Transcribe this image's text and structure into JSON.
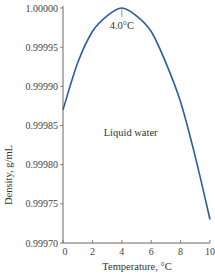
{
  "chart_data": {
    "type": "line",
    "title": "",
    "xlabel": "Temperature, °C",
    "ylabel": "Density, g/mL",
    "xlim": [
      0,
      10
    ],
    "ylim": [
      0.9997,
      1.0
    ],
    "x_ticks": [
      "0",
      "2",
      "4",
      "6",
      "8",
      "10"
    ],
    "y_ticks": [
      "0.99970",
      "0.99975",
      "0.99980",
      "0.99985",
      "0.99990",
      "0.99995",
      "1.00000"
    ],
    "grid": false,
    "legend": null,
    "series": [
      {
        "name": "Liquid water",
        "color": "#2b5aa8",
        "x": [
          0,
          1,
          2,
          3,
          4,
          5,
          6,
          7,
          8,
          9,
          10
        ],
        "y": [
          0.99987,
          0.99993,
          0.99997,
          0.99999,
          1.0,
          0.99999,
          0.99997,
          0.99993,
          0.99988,
          0.99981,
          0.99973
        ]
      }
    ],
    "annotations": [
      {
        "text": "4.0°C",
        "x": 4,
        "y": 1.0,
        "kind": "max-marker"
      },
      {
        "text": "Liquid water",
        "x": 4.6,
        "y": 0.99984,
        "kind": "region-label"
      }
    ]
  }
}
